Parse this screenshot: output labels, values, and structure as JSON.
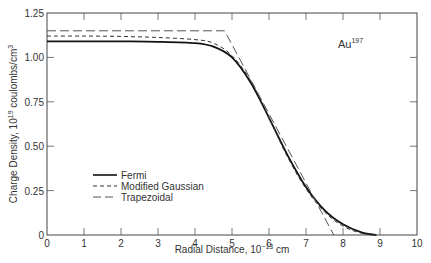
{
  "chart_data": {
    "type": "line",
    "title": "",
    "xlabel": "Radial Distance, 10^-13 cm",
    "ylabel": "Charge Density, 10^19 coulombs/cm^3",
    "xlim": [
      0,
      10
    ],
    "ylim": [
      0,
      1.25
    ],
    "x_ticks": [
      "0",
      "1",
      "2",
      "3",
      "4",
      "5",
      "6",
      "7",
      "8",
      "9",
      "10"
    ],
    "y_ticks": [
      "0",
      "0.25",
      "0.50",
      "0.75",
      "1.00",
      "1.25"
    ],
    "grid": false,
    "legend_position": "lower-left",
    "annotation": "Au197",
    "series": [
      {
        "name": "Fermi",
        "style": "solid",
        "x": [
          0,
          1,
          2,
          3,
          4,
          4.5,
          5,
          5.5,
          6,
          6.5,
          7,
          7.5,
          8,
          8.5,
          8.9
        ],
        "y": [
          1.09,
          1.09,
          1.09,
          1.088,
          1.08,
          1.06,
          1.0,
          0.86,
          0.66,
          0.45,
          0.27,
          0.14,
          0.06,
          0.015,
          0.0
        ]
      },
      {
        "name": "Modified Gaussian",
        "style": "dashed",
        "x": [
          0,
          1,
          2,
          3,
          4,
          4.5,
          5,
          5.5,
          6,
          6.5,
          7,
          7.5,
          8,
          8.5,
          8.9
        ],
        "y": [
          1.12,
          1.12,
          1.118,
          1.112,
          1.1,
          1.08,
          1.01,
          0.87,
          0.66,
          0.44,
          0.26,
          0.13,
          0.05,
          0.01,
          0.0
        ]
      },
      {
        "name": "Trapezoidal",
        "style": "long-dash",
        "x": [
          0,
          4.8,
          7.75
        ],
        "y": [
          1.15,
          1.15,
          0.0
        ]
      }
    ]
  },
  "labels": {
    "xlabel_main": "Radial Distance, 10",
    "xlabel_sup": "−13",
    "xlabel_tail": " cm",
    "ylabel_main": "Charge Density, 10",
    "ylabel_sup": "19",
    "ylabel_tail": " coulombs/cm",
    "ylabel_sup2": "3",
    "annot_main": "Au",
    "annot_sup": "197"
  },
  "legend": [
    "Fermi",
    "Modified Gaussian",
    "Trapezoidal"
  ]
}
